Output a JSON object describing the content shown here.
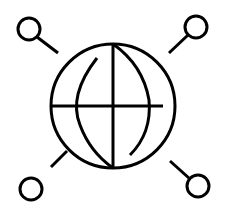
{
  "icon": {
    "name": "global-network-search-icon",
    "stroke_color": "#000000",
    "background_color": "#ffffff",
    "stroke_width": 3,
    "globe": {
      "cx": 113,
      "cy": 106,
      "r": 62
    },
    "nodes": [
      {
        "name": "top-left",
        "cx": 29,
        "cy": 29,
        "r": 11,
        "line": [
          37,
          37,
          58,
          53
        ]
      },
      {
        "name": "top-right",
        "cx": 196,
        "cy": 27,
        "r": 11,
        "line": [
          188,
          35,
          169,
          53
        ]
      },
      {
        "name": "bottom-left",
        "cx": 31,
        "cy": 189,
        "r": 11,
        "line": [
          51,
          167,
          67,
          151
        ]
      },
      {
        "name": "bottom-right",
        "cx": 198,
        "cy": 186,
        "r": 11,
        "line": [
          190,
          179,
          170,
          161
        ]
      }
    ]
  }
}
